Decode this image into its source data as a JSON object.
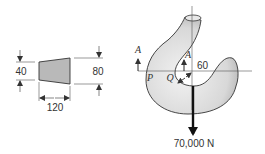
{
  "figure": {
    "type": "engineering-diagram",
    "cross_section": {
      "shape": "trapezoid",
      "left_height_label": "40",
      "right_height_label": "80",
      "width_label": "120",
      "fill_color": "#b9b9b9"
    },
    "hook": {
      "section_label_left": "A",
      "section_label_right": "A",
      "point_outer": "P",
      "point_inner": "Q",
      "inner_radius_label": "60",
      "load_label": "70,000 N",
      "fill_color": "#dcdcdc"
    },
    "colors": {
      "line": "#333333",
      "arrow": "#111111"
    }
  }
}
